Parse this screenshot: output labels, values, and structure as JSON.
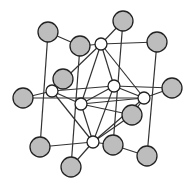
{
  "diagram": {
    "type": "crystal-lattice",
    "colors": {
      "large_atom": "#bdbdbd",
      "small_atom": "#ffffff",
      "stroke": "#222222",
      "bond": "#333333"
    },
    "atoms": [
      {
        "id": "g1",
        "kind": "large",
        "x": 48,
        "y": 32,
        "r": 10
      },
      {
        "id": "g2",
        "kind": "large",
        "x": 80,
        "y": 46,
        "r": 10
      },
      {
        "id": "g3",
        "kind": "large",
        "x": 123,
        "y": 21,
        "r": 10
      },
      {
        "id": "g4",
        "kind": "large",
        "x": 157,
        "y": 42,
        "r": 10
      },
      {
        "id": "g5",
        "kind": "large",
        "x": 63,
        "y": 79,
        "r": 10
      },
      {
        "id": "g6",
        "kind": "large",
        "x": 23,
        "y": 98,
        "r": 10
      },
      {
        "id": "g7",
        "kind": "large",
        "x": 172,
        "y": 88,
        "r": 10
      },
      {
        "id": "g8",
        "kind": "large",
        "x": 132,
        "y": 115,
        "r": 10
      },
      {
        "id": "g9",
        "kind": "large",
        "x": 40,
        "y": 147,
        "r": 10
      },
      {
        "id": "g10",
        "kind": "large",
        "x": 113,
        "y": 145,
        "r": 10
      },
      {
        "id": "g11",
        "kind": "large",
        "x": 71,
        "y": 167,
        "r": 10
      },
      {
        "id": "g12",
        "kind": "large",
        "x": 147,
        "y": 156,
        "r": 10
      },
      {
        "id": "w1",
        "kind": "small",
        "x": 101,
        "y": 44,
        "r": 6
      },
      {
        "id": "w2",
        "kind": "small",
        "x": 52,
        "y": 91,
        "r": 6
      },
      {
        "id": "w3",
        "kind": "small",
        "x": 114,
        "y": 86,
        "r": 6
      },
      {
        "id": "w4",
        "kind": "small",
        "x": 144,
        "y": 98,
        "r": 6
      },
      {
        "id": "w5",
        "kind": "small",
        "x": 81,
        "y": 104,
        "r": 6
      },
      {
        "id": "w6",
        "kind": "small",
        "x": 93,
        "y": 142,
        "r": 6
      }
    ],
    "bonds": [
      [
        "g1",
        "g2"
      ],
      [
        "g2",
        "w1"
      ],
      [
        "w1",
        "g3"
      ],
      [
        "w1",
        "g4"
      ],
      [
        "g1",
        "g9"
      ],
      [
        "g2",
        "g11"
      ],
      [
        "g3",
        "g10"
      ],
      [
        "g4",
        "g12"
      ],
      [
        "w1",
        "w2"
      ],
      [
        "w1",
        "w5"
      ],
      [
        "w1",
        "w3"
      ],
      [
        "w1",
        "w4"
      ],
      [
        "w2",
        "g5"
      ],
      [
        "w2",
        "g6"
      ],
      [
        "w2",
        "w3"
      ],
      [
        "w2",
        "w6"
      ],
      [
        "w3",
        "g7"
      ],
      [
        "w3",
        "w4"
      ],
      [
        "w3",
        "w6"
      ],
      [
        "w3",
        "w5"
      ],
      [
        "w4",
        "g7"
      ],
      [
        "w4",
        "w5"
      ],
      [
        "w4",
        "w6"
      ],
      [
        "w4",
        "g8"
      ],
      [
        "g6",
        "w4"
      ],
      [
        "w5",
        "g8"
      ],
      [
        "w5",
        "w6"
      ],
      [
        "w5",
        "w2"
      ],
      [
        "w6",
        "g9"
      ],
      [
        "w6",
        "g11"
      ],
      [
        "w6",
        "g10"
      ],
      [
        "w6",
        "g8"
      ],
      [
        "g10",
        "g12"
      ]
    ]
  }
}
